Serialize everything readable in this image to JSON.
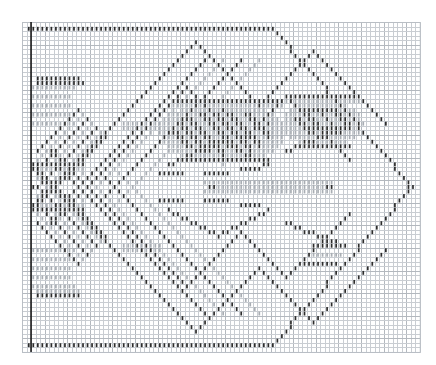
{
  "document": {
    "kind": "needlework-chart",
    "title": "Filet crochet / cross-stitch diamond motif chart",
    "background_color": "#ffffff"
  },
  "grid": {
    "origin_x": 22,
    "origin_y": 22,
    "cell_w": 4.52,
    "cell_h": 4.52,
    "cols": 88,
    "rows": 73,
    "line_color": "#c9cdd2",
    "major_line_color": "#b3b8be",
    "major_every": 5,
    "edge_color": "#b9bec4",
    "selvedge": {
      "name": "left-heavy-rule",
      "color": "#1a1a1a",
      "x_col": 2,
      "width_px": 1.6,
      "y_top_row": 0,
      "y_bottom_row": 73
    }
  },
  "stitch_marks": {
    "description": "Each filled cell is drawn as a short vertical tick centered in the cell.",
    "dark_color": "#2b2b2b",
    "light_color": "#a8adb3",
    "mid_color": "#808890",
    "tick_width_px": 1.7,
    "tick_height_ratio": 0.86
  },
  "chart_data": {
    "type": "heatmap",
    "xlabel": "",
    "ylabel": "",
    "grid": true,
    "legend_position": "none",
    "categories": [],
    "values": [],
    "levels": [
      {
        "name": "empty",
        "code": 0,
        "color": "#ffffff",
        "label": "open mesh"
      },
      {
        "name": "light",
        "code": 1,
        "color": "#a8adb3",
        "label": "light fill"
      },
      {
        "name": "dark",
        "code": 2,
        "color": "#2b2b2b",
        "label": "solid fill"
      }
    ],
    "cols": 88,
    "rows": 73,
    "motif": {
      "name": "large-diamond-lozenge",
      "left_col": 1,
      "right_tip_col": 86,
      "top_row": 1,
      "bottom_row": 71,
      "center_row": 36
    },
    "shapes": [
      {
        "name": "top-border-run",
        "kind": "hline",
        "row": 1,
        "col_start": 1,
        "col_end": 55,
        "tone": "dark"
      },
      {
        "name": "bottom-border-run",
        "kind": "hline",
        "row": 71,
        "col_start": 1,
        "col_end": 55,
        "tone": "dark"
      },
      {
        "name": "outer-diamond-upper-right",
        "kind": "diag",
        "col_start": 55,
        "row_start": 1,
        "col_end": 86,
        "row_end": 36,
        "tone": "dark"
      },
      {
        "name": "outer-diamond-lower-right",
        "kind": "diag",
        "col_start": 55,
        "row_start": 71,
        "col_end": 86,
        "row_end": 36,
        "tone": "dark"
      },
      {
        "name": "inner-chevron-upper",
        "kind": "chevron",
        "apex_col": 38,
        "apex_row": 9,
        "left_col": 1,
        "right_col": 70,
        "tone": "dark"
      },
      {
        "name": "inner-chevron-lower",
        "kind": "chevron",
        "apex_col": 38,
        "apex_row": 63,
        "left_col": 1,
        "right_col": 70,
        "tone": "dark"
      },
      {
        "name": "central-leaf-upper",
        "kind": "leaf",
        "center_col": 44,
        "center_row": 26,
        "tone": "mixed"
      },
      {
        "name": "central-leaf-lower",
        "kind": "leaf",
        "center_col": 44,
        "center_row": 46,
        "tone": "mixed"
      },
      {
        "name": "left-fan-upper",
        "kind": "fan",
        "center_col": 12,
        "center_row": 20,
        "tone": "mixed"
      },
      {
        "name": "left-fan-lower",
        "kind": "fan",
        "center_col": 12,
        "center_row": 52,
        "tone": "mixed"
      },
      {
        "name": "right-scroll-upper",
        "kind": "scroll",
        "center_col": 64,
        "center_row": 24,
        "tone": "mixed"
      },
      {
        "name": "right-scroll-lower",
        "kind": "scroll",
        "center_col": 64,
        "center_row": 48,
        "tone": "mixed"
      }
    ]
  }
}
